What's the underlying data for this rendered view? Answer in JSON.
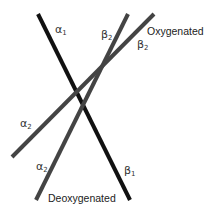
{
  "diagram": {
    "type": "hemoglobin subunit interface shift",
    "lines": [
      {
        "id": "alpha1-beta1",
        "color": "#111111",
        "x1": 38,
        "y1": 14,
        "x2": 130,
        "y2": 200,
        "width": 4
      },
      {
        "id": "alpha2-beta2-deoxy",
        "color": "#444444",
        "x1": 36,
        "y1": 200,
        "x2": 128,
        "y2": 14,
        "width": 4
      },
      {
        "id": "alpha2-beta2-oxy",
        "color": "#444444",
        "x1": 12,
        "y1": 157,
        "x2": 154,
        "y2": 14,
        "width": 4
      }
    ],
    "labels": {
      "alpha1": {
        "greek": "α",
        "sub": "1"
      },
      "beta2_deoxy_top": {
        "greek": "β",
        "sub": "2"
      },
      "oxygenated": "Oxygenated",
      "beta2_oxy_top": {
        "greek": "β",
        "sub": "2"
      },
      "alpha2_oxy_bottom": {
        "greek": "α",
        "sub": "2"
      },
      "alpha2_deoxy_bottom": {
        "greek": "α",
        "sub": "2"
      },
      "beta1": {
        "greek": "β",
        "sub": "1"
      },
      "deoxygenated": "Deoxygenated"
    }
  }
}
